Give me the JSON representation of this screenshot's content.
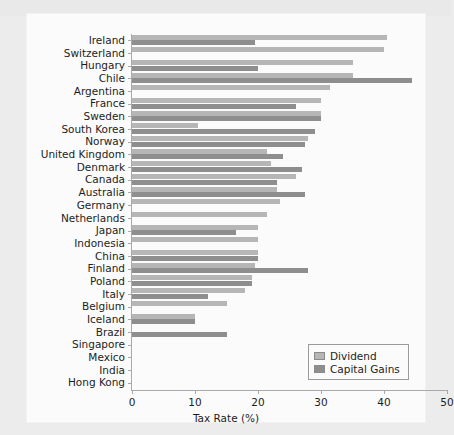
{
  "chart_data": {
    "type": "bar",
    "orientation": "horizontal",
    "title": "",
    "xlabel": "Tax Rate (%)",
    "ylabel": "",
    "xlim": [
      0,
      50
    ],
    "xticks": [
      0,
      10,
      20,
      30,
      40,
      50
    ],
    "grid": false,
    "legend_position": "bottom-right",
    "categories": [
      "Ireland",
      "Switzerland",
      "Hungary",
      "Chile",
      "Argentina",
      "France",
      "Sweden",
      "South Korea",
      "Norway",
      "United Kingdom",
      "Denmark",
      "Canada",
      "Australia",
      "Germany",
      "Netherlands",
      "Japan",
      "Indonesia",
      "China",
      "Finland",
      "Poland",
      "Italy",
      "Belgium",
      "Iceland",
      "Brazil",
      "Singapore",
      "Mexico",
      "India",
      "Hong Kong"
    ],
    "series": [
      {
        "name": "Dividend",
        "color": "#b6b6b6",
        "values": [
          40.5,
          40.0,
          35.0,
          35.0,
          31.5,
          30.0,
          30.0,
          10.5,
          28.0,
          21.5,
          22.0,
          26.0,
          23.0,
          23.5,
          21.5,
          20.0,
          20.0,
          20.0,
          19.5,
          19.0,
          18.0,
          15.0,
          10.0,
          0.0,
          0.0,
          0.0,
          0.0,
          0.0
        ]
      },
      {
        "name": "Capital Gains",
        "color": "#8e8e8e",
        "values": [
          19.5,
          0.0,
          20.0,
          44.5,
          0.0,
          26.0,
          30.0,
          29.0,
          27.5,
          24.0,
          27.0,
          23.0,
          27.5,
          0.0,
          0.0,
          16.5,
          0.0,
          20.0,
          28.0,
          19.0,
          12.0,
          0.0,
          10.0,
          15.0,
          0.0,
          0.0,
          0.0,
          0.0
        ]
      }
    ]
  },
  "legend": {
    "items": [
      {
        "label": "Dividend",
        "swatch": "dividend-swatch"
      },
      {
        "label": "Capital Gains",
        "swatch": "capital-gains-swatch"
      }
    ]
  }
}
